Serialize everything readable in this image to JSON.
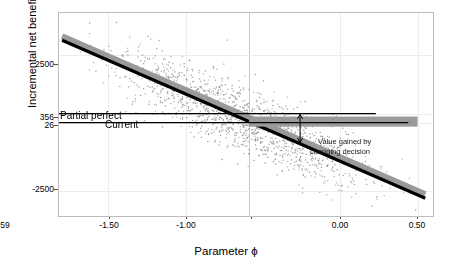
{
  "chart_data": {
    "type": "scatter",
    "title": "",
    "xlabel": "Parameter ϕ",
    "ylabel": "Incremental net benefit",
    "xlim": [
      -1.82,
      0.6
    ],
    "ylim": [
      -3400,
      4050
    ],
    "xticks": [
      -1.5,
      -1.0,
      -0.59,
      0.0,
      0.5
    ],
    "xticklabels": [
      "-1.50",
      "-1.00",
      "-0.59",
      "0.00",
      "0.50"
    ],
    "yticks": [
      2500,
      356,
      26,
      -2500
    ],
    "yticklabels": [
      "2500",
      "356",
      "26",
      "-2500"
    ],
    "grid": true,
    "legend_position": "none",
    "n_points": 1400,
    "scatter_color": "#808080",
    "fit_line_color": "#000000",
    "ribbon_color": "#9a9a9a",
    "series": [
      {
        "name": "Simulated incremental net benefit",
        "description": "Grey scatter cloud of Monte Carlo simulations, dense around the regression line",
        "x_range": [
          -1.8,
          0.55
        ],
        "y_at_xmin": 3050,
        "y_at_xmax": -2750,
        "spread_sd": 620
      },
      {
        "name": "Loess / linear fit",
        "type": "line",
        "x": [
          -1.8,
          0.55
        ],
        "y": [
          3050,
          -2750
        ],
        "slope": -2468,
        "intercept": -1392
      },
      {
        "name": "Confidence ribbon",
        "type": "area",
        "offset": 150
      }
    ],
    "reference_lines": [
      {
        "name": "partial-perfect-information",
        "label": "Partial perfect",
        "orientation": "horizontal",
        "y": 356,
        "x_start": -1.82,
        "x_end": 0.23,
        "color": "#000000"
      },
      {
        "name": "current-decision",
        "label": "Current",
        "orientation": "horizontal",
        "y": 26,
        "x_start": -1.82,
        "x_end": 0.44,
        "color": "#000000"
      },
      {
        "name": "threshold-phi",
        "label": "-0.59",
        "orientation": "vertical",
        "x": -0.59,
        "color": "#c9c9c9"
      }
    ],
    "bands": [
      {
        "name": "expected-value-band",
        "y_low": -120,
        "y_high": 250,
        "x_start": -0.59,
        "x_end": 0.5,
        "color": "#9a9a9a"
      }
    ],
    "annotations": [
      {
        "name": "value-gained-annotation",
        "text_line1": "Value gained by",
        "text_line2": "changing decision",
        "x": -0.13,
        "y": -430,
        "arrow": {
          "name": "value-gained-arrow",
          "x": -0.26,
          "y_from": -700,
          "y_to": 330,
          "double_headed": true
        }
      }
    ]
  },
  "labels": {
    "partial_perfect": "Partial perfect",
    "current": "Current",
    "annotation_line1": "Value gained by",
    "annotation_line2": "changing decision"
  },
  "axis": {
    "y_title": "Incremental net benefit",
    "x_title": "Parameter ϕ",
    "y_tick_2500": "2500",
    "y_tick_356": "356",
    "y_tick_26": "26",
    "y_tick_neg2500": "-2500",
    "x_tick_neg150": "-1.50",
    "x_tick_neg100": "-1.00",
    "x_tick_neg059": "-0.59",
    "x_tick_000": "0.00",
    "x_tick_050": "0.50"
  }
}
